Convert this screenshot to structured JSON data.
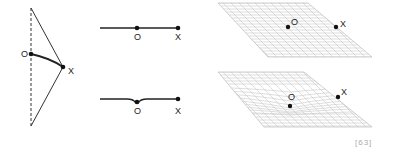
{
  "figure": {
    "panel_pendulum": {
      "label_o": "O",
      "label_x": "X"
    },
    "panel_flat_line": {
      "label_o": "O",
      "label_x": "X"
    },
    "panel_dipped_line": {
      "label_o": "O",
      "label_x": "X"
    },
    "panel_flat_grid": {
      "label_o": "O",
      "label_x": "X"
    },
    "panel_curved_grid": {
      "label_o": "O",
      "label_x": "X"
    },
    "reference": "[63]"
  },
  "colors": {
    "ink": "#222222",
    "grid": "#c8c8c8",
    "reference": "#aaaaaa"
  }
}
